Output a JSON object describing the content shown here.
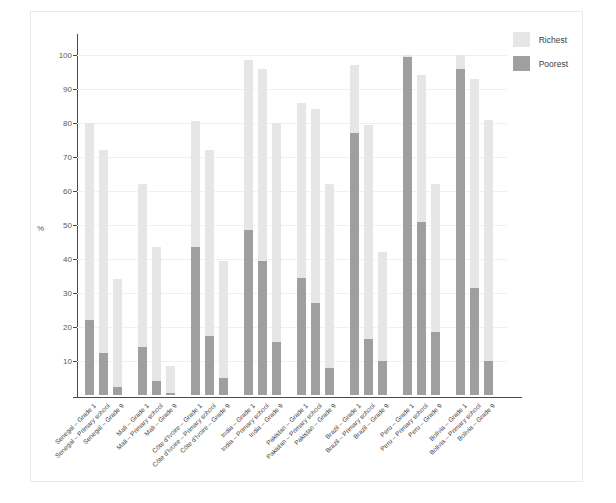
{
  "chart_data": {
    "type": "bar",
    "title": "",
    "xlabel": "",
    "ylabel": "%",
    "ylim": [
      0,
      105
    ],
    "yticks": [
      10,
      20,
      30,
      40,
      50,
      60,
      70,
      80,
      90,
      100
    ],
    "grid": true,
    "legend_position": "top-right",
    "legend": [
      "Richest",
      "Poorest"
    ],
    "colors": {
      "richest": "#e6e6e6",
      "poorest": "#9f9f9f",
      "axis": "#4a4a4a",
      "grid": "#f0f0f0"
    },
    "categories": [
      "Senegal – Grade 1",
      "Senegal – Primary school",
      "Senegal – Grade 9",
      "Mali – Grade 1",
      "Mali – Primary school",
      "Mali – Grade 9",
      "Côte d'Ivoire – Grade 1",
      "Côte d'Ivoire – Primary school",
      "Côte d'Ivoire – Grade 9",
      "India – Grade 1",
      "India – Primary school",
      "India – Grade 9",
      "Pakistan – Grade 1",
      "Pakistan – Primary school",
      "Pakistan – Grade 9",
      "Brazil – Grade 1",
      "Brazil – Primary school",
      "Brazil – Grade 9",
      "Peru – Grade 1",
      "Peru – Primary school",
      "Peru – Grade 9",
      "Bolivia – Grade 1",
      "Bolivia – Primary school",
      "Bolivia – Grade 9"
    ],
    "groups": [
      {
        "country": "Senegal",
        "labels": [
          "Grade 1",
          "Primary school",
          "Grade 9"
        ]
      },
      {
        "country": "Mali",
        "labels": [
          "Grade 1",
          "Primary school",
          "Grade 9"
        ]
      },
      {
        "country": "Côte d'Ivoire",
        "labels": [
          "Grade 1",
          "Primary school",
          "Grade 9"
        ]
      },
      {
        "country": "India",
        "labels": [
          "Grade 1",
          "Primary school",
          "Grade 9"
        ]
      },
      {
        "country": "Pakistan",
        "labels": [
          "Grade 1",
          "Primary school",
          "Grade 9"
        ]
      },
      {
        "country": "Brazil",
        "labels": [
          "Grade 1",
          "Primary school",
          "Grade 9"
        ]
      },
      {
        "country": "Peru",
        "labels": [
          "Grade 1",
          "Primary school",
          "Grade 9"
        ]
      },
      {
        "country": "Bolivia",
        "labels": [
          "Grade 1",
          "Primary school",
          "Grade 9"
        ]
      }
    ],
    "series": [
      {
        "name": "Richest",
        "color": "#e6e6e6",
        "values": [
          80,
          72,
          34,
          62,
          43.5,
          8.5,
          80.5,
          72,
          39.5,
          98.5,
          96,
          80,
          86,
          84,
          62,
          97,
          79.5,
          42,
          100,
          94,
          62,
          100,
          93,
          81
        ]
      },
      {
        "name": "Poorest",
        "color": "#9f9f9f",
        "values": [
          22,
          12.5,
          2.5,
          14,
          4,
          0.5,
          43.5,
          17.5,
          5,
          48.5,
          39.5,
          15.5,
          34.5,
          27,
          8,
          77,
          16.5,
          10,
          99.5,
          51,
          18.5,
          96,
          31.5,
          10
        ]
      }
    ]
  }
}
